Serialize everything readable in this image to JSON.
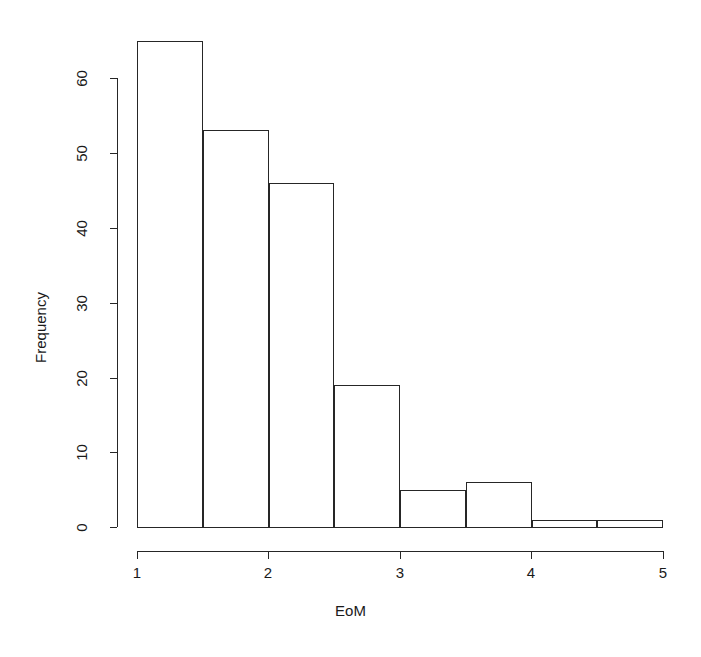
{
  "chart_data": {
    "type": "bar",
    "title": "",
    "subtitle": "",
    "xlabel": "EoM",
    "ylabel": "Frequency",
    "xlim": [
      1,
      5
    ],
    "ylim": [
      0,
      65
    ],
    "grid": false,
    "legend": null,
    "bin_width": 0.5,
    "bin_edges": [
      1,
      1.5,
      2,
      2.5,
      3,
      3.5,
      4,
      4.5,
      5
    ],
    "categories": [
      "1-1.5",
      "1.5-2",
      "2-2.5",
      "2.5-3",
      "3-3.5",
      "3.5-4",
      "4-4.5",
      "4.5-5"
    ],
    "values": [
      65,
      53,
      46,
      19,
      5,
      6,
      1,
      1
    ],
    "xticks": [
      {
        "value": 1,
        "label": "1"
      },
      {
        "value": 2,
        "label": "2"
      },
      {
        "value": 3,
        "label": "3"
      },
      {
        "value": 4,
        "label": "4"
      },
      {
        "value": 5,
        "label": "5"
      }
    ],
    "yticks": [
      {
        "value": 0,
        "label": "0"
      },
      {
        "value": 10,
        "label": "10"
      },
      {
        "value": 20,
        "label": "20"
      },
      {
        "value": 30,
        "label": "30"
      },
      {
        "value": 40,
        "label": "40"
      },
      {
        "value": 50,
        "label": "50"
      },
      {
        "value": 60,
        "label": "60"
      }
    ],
    "bar_fill_color": "#ffffff",
    "bar_border_color": "#262626",
    "axis_color": "#262626",
    "background_color": "#ffffff"
  }
}
